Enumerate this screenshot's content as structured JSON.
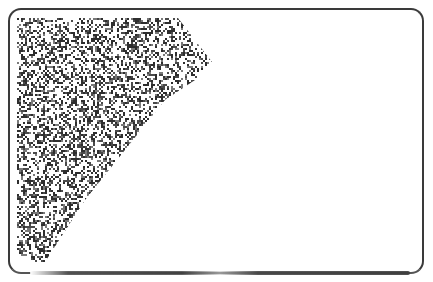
{
  "image": {
    "description": "Rounded-rectangle card outline with a dithered noise texture region in the upper-left corner",
    "frame": {
      "x": 8,
      "y": 8,
      "width": 416,
      "height": 266,
      "radius": 13,
      "stroke": "#3a3a3a"
    },
    "texture": {
      "color": "#3c3c3c",
      "polygon": [
        [
          17,
          18
        ],
        [
          178,
          18
        ],
        [
          212,
          62
        ],
        [
          195,
          80
        ],
        [
          165,
          100
        ],
        [
          125,
          150
        ],
        [
          85,
          200
        ],
        [
          45,
          262
        ],
        [
          17,
          262
        ]
      ]
    }
  }
}
